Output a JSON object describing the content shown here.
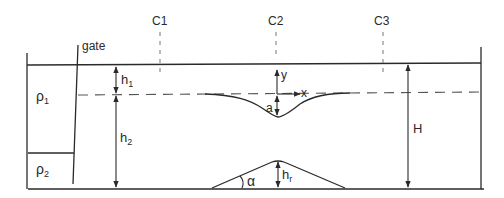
{
  "diagram": {
    "type": "two-layer stratified flow over bottom ridge",
    "labels": {
      "gate": "gate",
      "c1": "C1",
      "c2": "C2",
      "c3": "C3",
      "rho1": "ρ",
      "rho1_sub": "1",
      "rho2": "ρ",
      "rho2_sub": "2",
      "h1": "h",
      "h1_sub": "1",
      "h2": "h",
      "h2_sub": "2",
      "H": "H",
      "y_axis": "y",
      "x_axis": "x",
      "a": "a",
      "alpha": "α",
      "hr": "h",
      "hr_sub": "r"
    },
    "colors": {
      "line": "#2a2a2a",
      "dashed": "#555555",
      "background": "#ffffff"
    }
  }
}
